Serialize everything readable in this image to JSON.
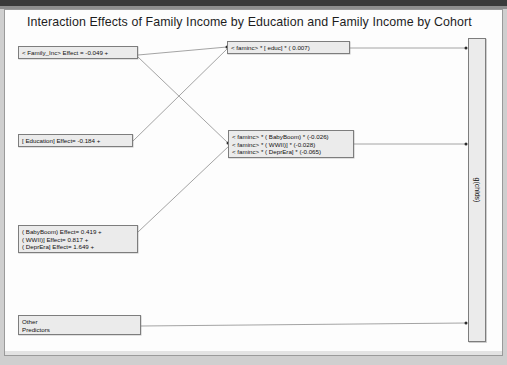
{
  "document": {
    "title": "Interaction Effects of Family Income by Education and Family Income by Cohort"
  },
  "nodes": {
    "family_income": {
      "name": "family-income-node",
      "lines": [
        "< Family_Inc>  Effect = -0.049 +"
      ]
    },
    "education": {
      "name": "education-node",
      "lines": [
        "[ Education]  Effect= -0.184 +"
      ]
    },
    "cohort": {
      "name": "cohort-node",
      "lines": [
        "( BabyBoom)  Effect=  0.419 +",
        "( WWII)] Effect= 0.817 +",
        "( DeprEra] Effect=  1.649 +"
      ]
    },
    "other_predictors": {
      "name": "other-predictors-node",
      "lines": [
        "Other",
        "Predictors"
      ]
    },
    "faminc_x_educ": {
      "name": "faminc-by-educ-interaction-node",
      "lines": [
        "< faminc> *  [ educ] * ( 0.007)"
      ]
    },
    "faminc_x_cohort": {
      "name": "faminc-by-cohort-interaction-node",
      "lines": [
        "< faminc> *  ( BabyBoom) * (-0.026)",
        "< faminc> *  ( WWII)] * (-0.028)",
        "< faminc> *  ( DeprEra] * (-0.065)"
      ]
    },
    "outcome": {
      "name": "outcome-bar",
      "label": "g(chlds)"
    }
  },
  "edges": [
    {
      "name": "edge-family-income-to-faminc-educ",
      "from": "family_income",
      "to": "faminc_x_educ"
    },
    {
      "name": "edge-family-income-to-faminc-cohort",
      "from": "family_income",
      "to": "faminc_x_cohort"
    },
    {
      "name": "edge-education-to-faminc-educ",
      "from": "education",
      "to": "faminc_x_educ"
    },
    {
      "name": "edge-cohort-to-faminc-cohort",
      "from": "cohort",
      "to": "faminc_x_cohort"
    },
    {
      "name": "edge-faminc-educ-to-outcome",
      "from": "faminc_x_educ",
      "to": "outcome"
    },
    {
      "name": "edge-faminc-cohort-to-outcome",
      "from": "faminc_x_cohort",
      "to": "outcome"
    },
    {
      "name": "edge-other-predictors-to-outcome",
      "from": "other_predictors",
      "to": "outcome"
    }
  ],
  "colors": {
    "node_fill": "#ebebeb",
    "node_border": "#7d7d7d",
    "wire": "#8d8d8d",
    "page": "#fdfdfd",
    "text": "#111111"
  }
}
